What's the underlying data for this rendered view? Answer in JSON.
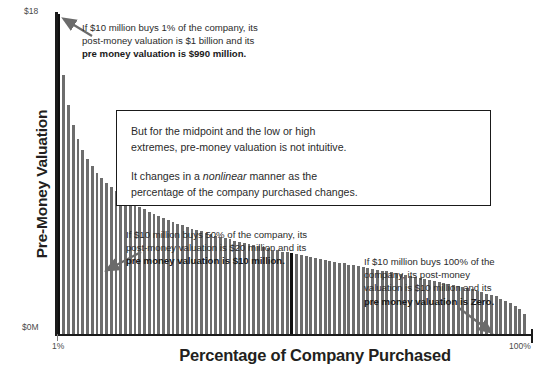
{
  "chart_data": {
    "type": "bar",
    "title": "",
    "xlabel": "Percentage of Company Purchased",
    "ylabel": "Pre-Money Valuation",
    "x_tick_labels": [
      "1%",
      "100%"
    ],
    "y_tick_labels": [
      "$0M",
      "$18"
    ],
    "ylim_labels": {
      "bottom": "$0M",
      "top": "$18"
    },
    "grid": false,
    "legend": null,
    "note": "Pre-money valuation = $10 million x (100 - p) / p, for p = percentage of company purchased. Bars decay hyperbolically from 1% to 100%.",
    "highlighted_category": "50%",
    "categories": [
      "1%",
      "2%",
      "3%",
      "4%",
      "5%",
      "6%",
      "7%",
      "8%",
      "9%",
      "10%",
      "11%",
      "12%",
      "13%",
      "14%",
      "15%",
      "16%",
      "17%",
      "18%",
      "19%",
      "20%",
      "21%",
      "22%",
      "23%",
      "24%",
      "25%",
      "26%",
      "27%",
      "28%",
      "29%",
      "30%",
      "31%",
      "32%",
      "33%",
      "34%",
      "35%",
      "36%",
      "37%",
      "38%",
      "39%",
      "40%",
      "41%",
      "42%",
      "43%",
      "44%",
      "45%",
      "46%",
      "47%",
      "48%",
      "49%",
      "50%",
      "51%",
      "52%",
      "53%",
      "54%",
      "55%",
      "56%",
      "57%",
      "58%",
      "59%",
      "60%",
      "61%",
      "62%",
      "63%",
      "64%",
      "65%",
      "66%",
      "67%",
      "68%",
      "69%",
      "70%",
      "71%",
      "72%",
      "73%",
      "74%",
      "75%",
      "76%",
      "77%",
      "78%",
      "79%",
      "80%",
      "81%",
      "82%",
      "83%",
      "84%",
      "85%",
      "86%",
      "87%",
      "88%",
      "89%",
      "90%",
      "91%",
      "92%",
      "93%",
      "94%",
      "95%",
      "96%",
      "97%",
      "98%",
      "99%",
      "100%"
    ],
    "values": [
      990.0,
      490.0,
      323.3,
      240.0,
      190.0,
      156.7,
      132.9,
      115.0,
      101.1,
      90.0,
      80.9,
      73.3,
      66.9,
      61.4,
      56.7,
      52.5,
      48.8,
      45.6,
      42.6,
      40.0,
      37.6,
      35.5,
      33.5,
      31.7,
      30.0,
      28.5,
      27.0,
      25.7,
      24.5,
      23.3,
      22.3,
      21.3,
      20.3,
      19.4,
      18.6,
      17.8,
      17.0,
      16.3,
      15.6,
      15.0,
      14.4,
      13.8,
      13.3,
      12.7,
      12.2,
      11.7,
      11.3,
      10.8,
      10.4,
      10.0,
      9.6,
      9.2,
      8.9,
      8.5,
      8.2,
      7.9,
      7.5,
      7.2,
      7.0,
      6.7,
      6.4,
      6.1,
      5.9,
      5.6,
      5.4,
      5.2,
      4.9,
      4.7,
      4.5,
      4.3,
      4.1,
      3.9,
      3.7,
      3.5,
      3.3,
      3.2,
      3.0,
      2.8,
      2.7,
      2.5,
      2.3,
      2.2,
      2.0,
      1.9,
      1.8,
      1.6,
      1.5,
      1.4,
      1.2,
      1.1,
      1.0,
      0.9,
      0.8,
      0.6,
      0.5,
      0.4,
      0.3,
      0.2,
      0.1,
      0.0
    ],
    "value_units": "$ millions"
  },
  "annotations": {
    "top": {
      "line1": "If $10 million buys 1% of the company, its",
      "line2": "post-money valuation is $1 billion and its",
      "line3_bold": "pre money valuation is $990 million."
    },
    "middle": {
      "line1": "If $10 million buys 50% of the company, its",
      "line2": "post-money valuation is $20 million and its",
      "line3_bold": "pre money valuation is $10 million."
    },
    "right": {
      "line1": "If $10 million buys 100% of the",
      "line2": "company, its post-money",
      "line3": "valuation is $10 million and its",
      "line4_bold": "pre money valuation is Zero."
    },
    "boxed": {
      "para1_line1": "But for the midpoint and the low or high",
      "para1_line2": "extremes, pre-money valuation is not intuitive.",
      "para2_pre": "It changes in a ",
      "para2_italic": "nonlinear",
      "para2_post": " manner as the",
      "para2_line2": "percentage of the company purchased changes."
    }
  },
  "axes": {
    "y_title": "Pre-Money Valuation",
    "x_title": "Percentage of Company Purchased",
    "y_top_label": "$18",
    "y_bottom_label": "$0M",
    "x_left_label": "1%",
    "x_right_label": "100%"
  },
  "colors": {
    "bar": "#6d6d6d",
    "bar_highlight": "#111111",
    "axis": "#1a1a1a",
    "text": "#2b2b2b",
    "arrow": "#6b6b6b"
  }
}
